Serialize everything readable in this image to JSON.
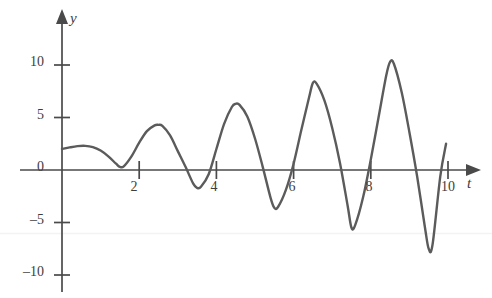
{
  "chart_data": {
    "type": "line",
    "title": "",
    "subtitle": "",
    "xlabel": "t",
    "ylabel": "y",
    "grid": false,
    "legend": null,
    "legend_position": "none",
    "xlim": [
      0,
      10.6
    ],
    "ylim": [
      -11.5,
      12.5
    ],
    "xticks": [
      2,
      4,
      6,
      8,
      10
    ],
    "xtick_labels": [
      "2",
      "4",
      "6",
      "8",
      "10"
    ],
    "yticks": [
      10,
      5,
      0,
      -5,
      -10
    ],
    "ytick_labels": [
      "10",
      "5",
      "0",
      "–5",
      "–10"
    ],
    "axis_arrows": [
      "x-right",
      "y-up"
    ],
    "series": [
      {
        "name": "y(t)",
        "color": "#5b5b5b",
        "line_width": 2.4,
        "description": "Oscillation of growing amplitude about zero, period about 2 units",
        "annotations": [
          {
            "t": 0.0,
            "y": 2.0,
            "kind": "start"
          },
          {
            "t": 0.6,
            "y": 2.3,
            "kind": "local-max"
          },
          {
            "t": 1.5,
            "y": 0.3,
            "kind": "local-min"
          },
          {
            "t": 2.5,
            "y": 4.3,
            "kind": "local-max"
          },
          {
            "t": 3.5,
            "y": -1.7,
            "kind": "local-min"
          },
          {
            "t": 4.5,
            "y": 6.3,
            "kind": "local-max"
          },
          {
            "t": 5.5,
            "y": -3.6,
            "kind": "local-min"
          },
          {
            "t": 6.5,
            "y": 8.3,
            "kind": "local-max"
          },
          {
            "t": 7.5,
            "y": -5.5,
            "kind": "local-min"
          },
          {
            "t": 8.5,
            "y": 10.3,
            "kind": "local-max"
          },
          {
            "t": 9.5,
            "y": -7.5,
            "kind": "local-min"
          },
          {
            "t": 9.95,
            "y": 2.5,
            "kind": "end"
          }
        ],
        "x": [
          0.0,
          0.2,
          0.4,
          0.6,
          0.8,
          1.0,
          1.2,
          1.4,
          1.5,
          1.6,
          1.8,
          2.0,
          2.2,
          2.4,
          2.5,
          2.6,
          2.8,
          3.0,
          3.2,
          3.4,
          3.5,
          3.6,
          3.8,
          4.0,
          4.2,
          4.4,
          4.5,
          4.6,
          4.8,
          5.0,
          5.2,
          5.4,
          5.5,
          5.6,
          5.8,
          6.0,
          6.2,
          6.4,
          6.5,
          6.6,
          6.8,
          7.0,
          7.2,
          7.4,
          7.5,
          7.6,
          7.8,
          8.0,
          8.2,
          8.4,
          8.5,
          8.6,
          8.8,
          9.0,
          9.2,
          9.4,
          9.5,
          9.6,
          9.8,
          9.95
        ],
        "y": [
          2.0,
          2.15,
          2.27,
          2.3,
          2.18,
          1.85,
          1.3,
          0.6,
          0.3,
          0.35,
          1.3,
          2.6,
          3.7,
          4.25,
          4.3,
          4.2,
          3.3,
          1.8,
          0.3,
          -1.3,
          -1.7,
          -1.6,
          -0.4,
          2.0,
          4.4,
          6.0,
          6.3,
          6.2,
          5.1,
          3.0,
          0.3,
          -2.6,
          -3.6,
          -3.5,
          -1.9,
          0.6,
          3.8,
          6.9,
          8.3,
          8.2,
          6.6,
          4.0,
          0.7,
          -3.4,
          -5.5,
          -5.2,
          -2.6,
          1.0,
          5.0,
          9.0,
          10.3,
          10.1,
          7.4,
          3.6,
          -0.6,
          -5.4,
          -7.5,
          -7.1,
          -0.6,
          2.5
        ]
      }
    ]
  },
  "figure": {
    "background_color": "#ffffff",
    "axis_color": "#4a4a4a",
    "tick_color": "#4a4a4a",
    "label_color": "#3d3d3d",
    "curve_color": "#5b5b5b"
  }
}
